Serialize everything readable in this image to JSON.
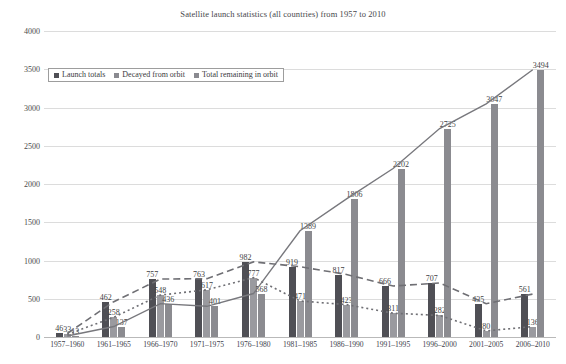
{
  "chart_data": {
    "type": "bar",
    "title": "Satellite launch statistics (all countries) from 1957 to 2010",
    "xlabel": "",
    "ylabel": "",
    "ylim": [
      0,
      4000
    ],
    "yticks": [
      0,
      500,
      1000,
      1500,
      2000,
      2500,
      3000,
      3500,
      4000
    ],
    "grid": true,
    "legend_position": "top-left-inside",
    "categories": [
      "1957–1960",
      "1961–1965",
      "1966–1970",
      "1971–1975",
      "1976–1980",
      "1981–1985",
      "1986–1990",
      "1991–1995",
      "1996–2000",
      "2001–2005",
      "2006–2010"
    ],
    "series": [
      {
        "name": "Launch totals",
        "color": "#4f4f55",
        "values": [
          46,
          462,
          757,
          763,
          982,
          919,
          817,
          666,
          707,
          435,
          561
        ]
      },
      {
        "name": "Decayed from orbit",
        "color": "#9a9a9f",
        "values": [
          33,
          258,
          548,
          617,
          777,
          471,
          423,
          311,
          282,
          80,
          136
        ]
      },
      {
        "name": "Total remaining in orbit",
        "color": "#8b8b90",
        "values": [
          13,
          137,
          436,
          401,
          568,
          1389,
          1806,
          2202,
          2725,
          3047,
          3494
        ]
      }
    ],
    "annotations": {
      "note": "Each bar carries its numeric data label above it; dashed and dotted trend lines overlay the launch-totals and decayed-from-orbit series, and a solid rising line tracks total remaining in orbit."
    }
  },
  "legend": {
    "items": [
      {
        "label": "Launch totals"
      },
      {
        "label": "Decayed from orbit"
      },
      {
        "label": "Total remaining in orbit"
      }
    ]
  }
}
